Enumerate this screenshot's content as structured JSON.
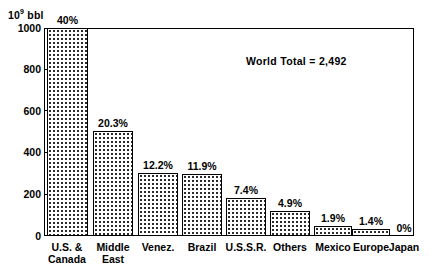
{
  "chart_data": {
    "type": "bar",
    "title": "",
    "subtitle": "",
    "xlabel": "",
    "ylabel": "10⁹ bbl",
    "ylabel_prefix": "10",
    "ylabel_exponent": "9",
    "ylabel_suffix": " bbl",
    "ylim": [
      0,
      1000
    ],
    "ytick_values": [
      0,
      200,
      400,
      600,
      800,
      1000
    ],
    "ytick_labels": [
      "0",
      "200",
      "400",
      "600",
      "800",
      "1000"
    ],
    "grid": false,
    "legend": false,
    "categories": [
      "U.S. &\nCanada",
      "Middle\nEast",
      "Venez.",
      "Brazil",
      "U.S.S.R.",
      "Others",
      "Mexico",
      "Europe",
      "Japan"
    ],
    "values": [
      1000,
      506,
      304,
      297,
      184,
      122,
      47,
      35,
      0
    ],
    "data_labels": [
      "40%",
      "20.3%",
      "12.2%",
      "11.9%",
      "7.4%",
      "4.9%",
      "1.9%",
      "1.4%",
      "0%"
    ],
    "percent_values": [
      40,
      20.3,
      12.2,
      11.9,
      7.4,
      4.9,
      1.9,
      1.4,
      0
    ],
    "annotations": [
      {
        "text": "World Total = 2,492",
        "x": 246,
        "y": 55
      }
    ],
    "bar_fill": "stipple-dot",
    "bar_edge_color": "#000000",
    "bar_fill_color": "#ffffff",
    "bar_dot_color": "#2b2b2b",
    "background_color": "#ffffff",
    "axis_color": "#000000"
  },
  "plot": {
    "left": 44,
    "top": 28,
    "width": 370,
    "height": 208,
    "baseline_y": 236,
    "bar_left_positions": [
      47,
      93,
      138,
      182,
      226,
      270,
      314,
      352,
      390
    ],
    "bar_widths": [
      41,
      40,
      40,
      40,
      40,
      40,
      38,
      38,
      0
    ],
    "cat_label_centers": [
      67,
      113,
      158,
      202,
      246,
      290,
      333,
      371,
      404
    ]
  }
}
